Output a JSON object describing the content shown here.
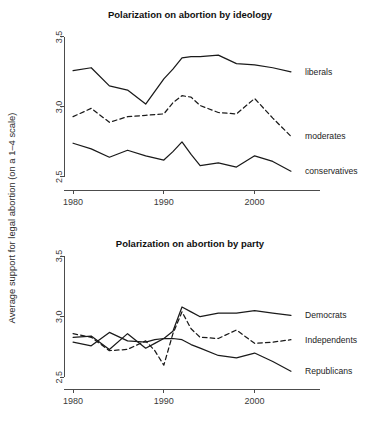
{
  "figure": {
    "axis_label": "Average support for legal abortion (on a 1–4 scale)",
    "background": "#ffffff",
    "ink": "#1a1a1a"
  },
  "chart_data": [
    {
      "type": "line",
      "title": "Polarization on abortion by ideology",
      "xlabel": "",
      "ylabel": "Average support for legal abortion (on a 1–4 scale)",
      "xlim": [
        1979,
        2005
      ],
      "ylim": [
        2.42,
        3.55
      ],
      "xticks": [
        1980,
        1990,
        2000
      ],
      "xtick_labels": [
        "1980",
        "1990",
        "2000"
      ],
      "yticks": [
        2.5,
        3.0,
        3.5
      ],
      "ytick_labels": [
        "2.5",
        "3.0",
        "3.5"
      ],
      "grid": false,
      "legend_position": "right-inline",
      "x": [
        1980,
        1982,
        1984,
        1986,
        1988,
        1990,
        1991,
        1992,
        1993,
        1994,
        1996,
        1998,
        2000,
        2002,
        2004
      ],
      "series": [
        {
          "name": "liberals",
          "style": "solid",
          "label": "liberals",
          "values": [
            3.26,
            3.28,
            3.15,
            3.12,
            3.02,
            3.2,
            3.27,
            3.35,
            3.36,
            3.36,
            3.37,
            3.31,
            3.3,
            3.28,
            3.25
          ]
        },
        {
          "name": "moderates",
          "style": "dashed",
          "label": "moderates",
          "values": [
            2.93,
            2.99,
            2.89,
            2.93,
            2.94,
            2.95,
            3.03,
            3.08,
            3.07,
            3.01,
            2.96,
            2.95,
            3.06,
            2.92,
            2.79
          ]
        },
        {
          "name": "conservatives",
          "style": "solid",
          "label": "conservatives",
          "values": [
            2.74,
            2.7,
            2.64,
            2.69,
            2.65,
            2.62,
            2.68,
            2.75,
            2.66,
            2.58,
            2.6,
            2.57,
            2.65,
            2.61,
            2.54
          ]
        }
      ]
    },
    {
      "type": "line",
      "title": "Polarization on abortion by party",
      "xlabel": "",
      "ylabel": "Average support for legal abortion (on a 1–4 scale)",
      "xlim": [
        1979,
        2005
      ],
      "ylim": [
        2.42,
        3.55
      ],
      "xticks": [
        1980,
        1990,
        2000
      ],
      "xtick_labels": [
        "1980",
        "1990",
        "2000"
      ],
      "yticks": [
        2.5,
        3.0,
        3.5
      ],
      "ytick_labels": [
        "2.5",
        "3.0",
        "3.5"
      ],
      "grid": false,
      "legend_position": "right-inline",
      "x": [
        1980,
        1982,
        1984,
        1986,
        1988,
        1989,
        1990,
        1991,
        1992,
        1993,
        1994,
        1996,
        1998,
        2000,
        2002,
        2004
      ],
      "series": [
        {
          "name": "Democrats",
          "style": "solid",
          "label": "Democrats",
          "values": [
            2.83,
            2.84,
            2.73,
            2.86,
            2.74,
            2.78,
            2.82,
            2.88,
            3.08,
            3.04,
            3.0,
            3.03,
            3.03,
            3.05,
            3.03,
            3.01
          ]
        },
        {
          "name": "Independents",
          "style": "dashed",
          "label": "Independents",
          "values": [
            2.86,
            2.83,
            2.72,
            2.73,
            2.8,
            2.72,
            2.6,
            2.86,
            3.04,
            2.9,
            2.83,
            2.82,
            2.89,
            2.78,
            2.79,
            2.81
          ]
        },
        {
          "name": "Republicans",
          "style": "solid",
          "label": "Republicans",
          "values": [
            2.79,
            2.76,
            2.87,
            2.8,
            2.79,
            2.81,
            2.82,
            2.82,
            2.81,
            2.77,
            2.74,
            2.68,
            2.66,
            2.7,
            2.63,
            2.55
          ]
        }
      ]
    }
  ]
}
